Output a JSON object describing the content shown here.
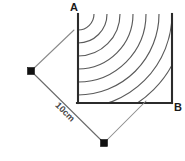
{
  "figure": {
    "labels": {
      "vertex_a": "A",
      "vertex_b": "B",
      "dimension": "10cm"
    },
    "colors": {
      "background": "#ffffff",
      "edge": "#2b2b2b",
      "arc": "#5a5a5a",
      "dimension_line": "#6b6b6b",
      "extension_line": "#8a8a8a",
      "marker": "#111111",
      "label_text": "#1a1a1a"
    },
    "geometry": {
      "square": {
        "left": 78,
        "right": 172,
        "top": 14,
        "bottom": 103,
        "side_length_label": "10cm"
      },
      "arc_center": {
        "x": 78,
        "y": 14
      },
      "arc_radii": [
        16,
        29,
        42,
        55,
        68,
        81,
        94,
        107
      ],
      "arc_count": 8,
      "dimension": {
        "marker_left": {
          "x": 31,
          "y": 71
        },
        "marker_bottom": {
          "x": 104,
          "y": 143
        },
        "angle_degrees": 45,
        "text_rotation_degrees": 45
      },
      "extension_lines": [
        {
          "x1": 31,
          "y1": 71,
          "x2": 74,
          "y2": 30
        },
        {
          "x1": 104,
          "y1": 143,
          "x2": 146,
          "y2": 101
        }
      ]
    },
    "icons": {
      "marker": "square-endpoint-marker"
    }
  }
}
